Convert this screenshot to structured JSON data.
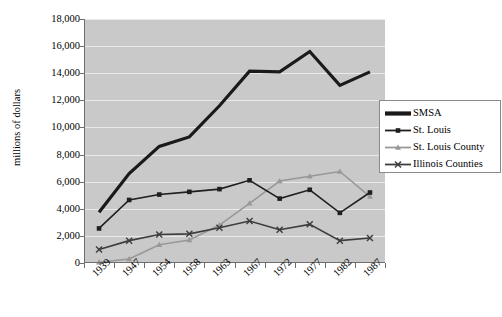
{
  "chart_data": {
    "type": "line",
    "title": "",
    "xlabel": "",
    "ylabel": "millions of dollars",
    "categories": [
      "1939",
      "1947",
      "1954",
      "1958",
      "1963",
      "1967",
      "1972",
      "1977",
      "1982",
      "1987"
    ],
    "ylim": [
      0,
      18000
    ],
    "ytick_step": 2000,
    "yticks": [
      "0",
      "2,000",
      "4,000",
      "6,000",
      "8,000",
      "10,000",
      "12,000",
      "14,000",
      "16,000",
      "18,000"
    ],
    "grid": true,
    "legend_position": "right",
    "plot_background": "#c9c9c9",
    "series": [
      {
        "name": "SMSA",
        "color": "#1a1a1a",
        "marker": "none",
        "width": 3.2,
        "values": [
          3750,
          6600,
          8600,
          9300,
          11600,
          14150,
          14100,
          15600,
          13100,
          14100
        ]
      },
      {
        "name": "St. Louis",
        "color": "#1f1f1f",
        "marker": "square",
        "width": 1.6,
        "values": [
          2550,
          4650,
          5050,
          5250,
          5450,
          6100,
          4750,
          5400,
          3700,
          5200
        ]
      },
      {
        "name": "St. Louis County",
        "color": "#989898",
        "marker": "triangle",
        "width": 1.6,
        "values": [
          50,
          300,
          1350,
          1700,
          2800,
          4400,
          6050,
          6400,
          6750,
          4900
        ]
      },
      {
        "name": "Illinois Counties",
        "color": "#3d3d3d",
        "marker": "cross",
        "width": 1.6,
        "values": [
          1000,
          1650,
          2100,
          2150,
          2600,
          3100,
          2450,
          2850,
          1650,
          1850
        ]
      }
    ]
  },
  "legend": {
    "items": [
      {
        "label": "SMSA"
      },
      {
        "label": "St. Louis"
      },
      {
        "label": "St. Louis County"
      },
      {
        "label": "Illinois Counties"
      }
    ]
  }
}
